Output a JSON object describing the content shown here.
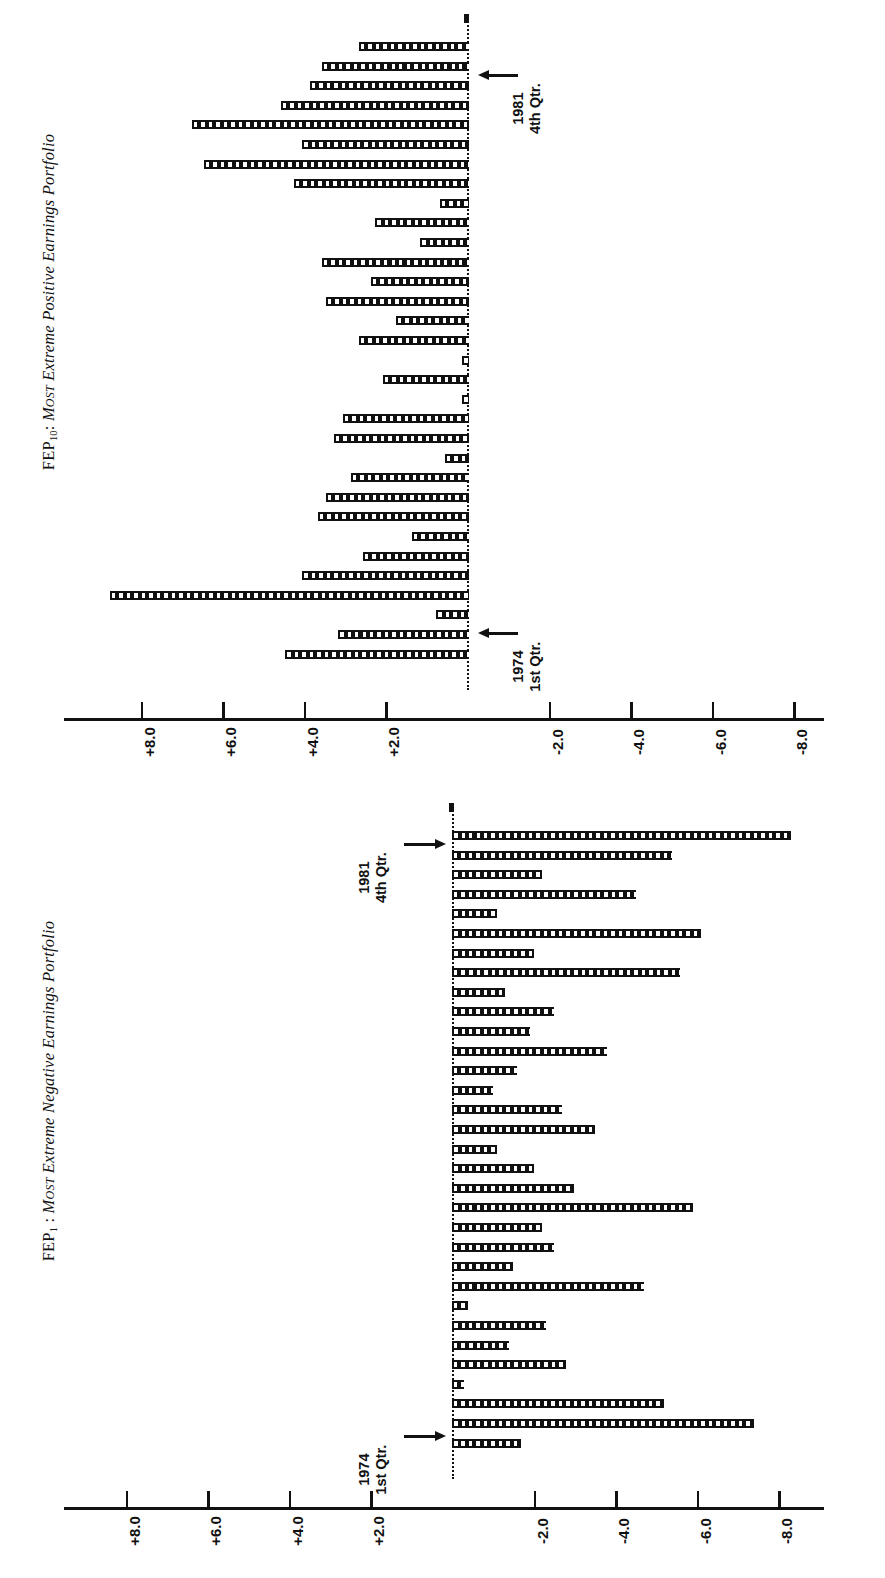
{
  "figure": {
    "panels": [
      {
        "id": "fep10",
        "title_prefix": "FEP",
        "title_sub": "10",
        "title_sep": ": ",
        "title_smallcaps": "Most",
        "title_italic": " Extreme Positive Earnings Portfolio",
        "title_plain": "FEP10: Most Extreme Positive Earnings Portfolio",
        "direction": "positive-left",
        "start_label_line1": "1974",
        "start_label_line2": "1st Qtr.",
        "end_label_line1": "1981",
        "end_label_line2": "4th Qtr."
      },
      {
        "id": "fep1",
        "title_prefix": "FEP",
        "title_sub": "1",
        "title_sep": " : ",
        "title_smallcaps": "Most",
        "title_italic": " Extreme Negative Earnings Portfolio",
        "title_plain": "FEP1 : Most Extreme Negative Earnings Portfolio",
        "direction": "negative-right",
        "start_label_line1": "1974",
        "start_label_line2": "1st Qtr.",
        "end_label_line1": "1981",
        "end_label_line2": "4th Qtr."
      }
    ],
    "axis": {
      "ticks": [
        "+8.0",
        "+6.0",
        "+4.0",
        "+2.0",
        "-2.0",
        "-4.0",
        "-6.0",
        "-8.0"
      ],
      "tick_values": [
        8,
        6,
        4,
        2,
        -2,
        -4,
        -6,
        -8
      ],
      "zero_shown": false
    }
  },
  "chart_data": [
    {
      "type": "bar",
      "title": "FEP10: Most Extreme Positive Earnings Portfolio",
      "orientation": "horizontal",
      "xlabel": "",
      "ylabel": "Abnormal return (%)",
      "xlim": [
        -9.5,
        9.5
      ],
      "grid": false,
      "legend": null,
      "note": "Quarterly abnormal returns, 1974 Q1 (bottom) through 1981 Q4 (top). Bars extend leftward for positive values.",
      "categories": [
        "1974 1st Qtr.",
        "1974 2nd Qtr.",
        "1974 3rd Qtr.",
        "1974 4th Qtr.",
        "1975 1st Qtr.",
        "1975 2nd Qtr.",
        "1975 3rd Qtr.",
        "1975 4th Qtr.",
        "1976 1st Qtr.",
        "1976 2nd Qtr.",
        "1976 3rd Qtr.",
        "1976 4th Qtr.",
        "1977 1st Qtr.",
        "1977 2nd Qtr.",
        "1977 3rd Qtr.",
        "1977 4th Qtr.",
        "1978 1st Qtr.",
        "1978 2nd Qtr.",
        "1978 3rd Qtr.",
        "1978 4th Qtr.",
        "1979 1st Qtr.",
        "1979 2nd Qtr.",
        "1979 3rd Qtr.",
        "1979 4th Qtr.",
        "1980 1st Qtr.",
        "1980 2nd Qtr.",
        "1980 3rd Qtr.",
        "1980 4th Qtr.",
        "1981 1st Qtr.",
        "1981 2nd Qtr.",
        "1981 3rd Qtr.",
        "1981 4th Qtr."
      ],
      "values": [
        4.5,
        3.2,
        0.8,
        8.8,
        4.1,
        2.6,
        1.4,
        3.7,
        3.5,
        2.9,
        0.6,
        3.3,
        3.1,
        0.1,
        2.1,
        0.1,
        2.7,
        1.8,
        3.5,
        2.4,
        3.6,
        1.2,
        2.3,
        0.7,
        4.3,
        6.5,
        4.1,
        6.8,
        4.6,
        3.9,
        3.6,
        2.7
      ]
    },
    {
      "type": "bar",
      "title": "FEP1 : Most Extreme Negative Earnings Portfolio",
      "orientation": "horizontal",
      "xlabel": "",
      "ylabel": "Abnormal return (%)",
      "xlim": [
        -9.5,
        9.5
      ],
      "grid": false,
      "legend": null,
      "note": "Quarterly abnormal returns, 1974 Q1 (bottom) through 1981 Q4 (top). Bars extend rightward for negative values.",
      "categories": [
        "1974 1st Qtr.",
        "1974 2nd Qtr.",
        "1974 3rd Qtr.",
        "1974 4th Qtr.",
        "1975 1st Qtr.",
        "1975 2nd Qtr.",
        "1975 3rd Qtr.",
        "1975 4th Qtr.",
        "1976 1st Qtr.",
        "1976 2nd Qtr.",
        "1976 3rd Qtr.",
        "1976 4th Qtr.",
        "1977 1st Qtr.",
        "1977 2nd Qtr.",
        "1977 3rd Qtr.",
        "1977 4th Qtr.",
        "1978 1st Qtr.",
        "1978 2nd Qtr.",
        "1978 3rd Qtr.",
        "1978 4th Qtr.",
        "1979 1st Qtr.",
        "1979 2nd Qtr.",
        "1979 3rd Qtr.",
        "1979 4th Qtr.",
        "1980 1st Qtr.",
        "1980 2nd Qtr.",
        "1980 3rd Qtr.",
        "1980 4th Qtr.",
        "1981 1st Qtr.",
        "1981 2nd Qtr.",
        "1981 3rd Qtr.",
        "1981 4th Qtr."
      ],
      "values": [
        -1.7,
        -7.4,
        -5.2,
        -0.3,
        -2.8,
        -1.4,
        -2.3,
        -0.4,
        -4.7,
        -1.5,
        -2.5,
        -2.2,
        -5.9,
        -3.0,
        -2.0,
        -1.1,
        -3.5,
        -2.7,
        -1.0,
        -1.6,
        -3.8,
        -1.9,
        -2.5,
        -1.3,
        -5.6,
        -2.0,
        -6.1,
        -1.1,
        -4.5,
        -2.2,
        -5.4,
        -8.3
      ]
    }
  ]
}
